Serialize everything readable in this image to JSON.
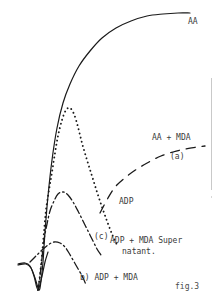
{
  "figure": {
    "caption": "fig.3",
    "background_color": "#ffffff",
    "ink_color": "#1a1a1a",
    "label_color": "#3a3a3a"
  },
  "labels": {
    "aa": "AA",
    "aa_mda": "AA + MDA",
    "a": "(a)",
    "adp": "ADP",
    "c": "(c)",
    "adp_mda_super": "ADP + MDA Super",
    "natant": "natant.",
    "b": "b) ADP + MDA"
  },
  "chart_data": {
    "type": "line",
    "title": "fig.3",
    "subtitle": "",
    "xlabel": "",
    "ylabel": "",
    "xlim": [
      0,
      220
    ],
    "ylim": [
      0,
      301
    ],
    "grid": false,
    "axes_visible": false,
    "legend": "inline-annotations",
    "note": "Platelet aggregometry traces; y axis inverted in pixel space (smaller y = greater aggregation).",
    "series": [
      {
        "name": "AA",
        "label": "AA",
        "style": "solid",
        "color": "#1a1a1a",
        "width": 1.2,
        "points": [
          [
            18,
            265
          ],
          [
            26,
            264
          ],
          [
            31,
            268
          ],
          [
            35,
            278
          ],
          [
            39,
            290
          ],
          [
            41,
            281
          ],
          [
            43,
            262
          ],
          [
            45,
            232
          ],
          [
            48,
            196
          ],
          [
            52,
            160
          ],
          [
            57,
            128
          ],
          [
            63,
            103
          ],
          [
            70,
            84
          ],
          [
            79,
            66
          ],
          [
            90,
            51
          ],
          [
            102,
            38
          ],
          [
            116,
            28
          ],
          [
            131,
            21
          ],
          [
            147,
            16
          ],
          [
            163,
            14
          ],
          [
            178,
            13
          ],
          [
            190,
            13
          ]
        ]
      },
      {
        "name": "ADP",
        "label": "ADP",
        "style": "dotted",
        "color": "#1a1a1a",
        "width": 1.6,
        "points": [
          [
            38,
            290
          ],
          [
            40,
            275
          ],
          [
            42,
            255
          ],
          [
            44,
            232
          ],
          [
            46,
            210
          ],
          [
            49,
            190
          ],
          [
            52,
            172
          ],
          [
            55,
            153
          ],
          [
            58,
            136
          ],
          [
            62,
            120
          ],
          [
            66,
            110
          ],
          [
            70,
            108
          ],
          [
            74,
            114
          ],
          [
            78,
            127
          ],
          [
            82,
            143
          ],
          [
            87,
            160
          ],
          [
            92,
            176
          ],
          [
            97,
            192
          ],
          [
            102,
            207
          ],
          [
            107,
            221
          ],
          [
            112,
            234
          ],
          [
            117,
            245
          ]
        ]
      },
      {
        "name": "AA + MDA",
        "label": "(a)",
        "style": "dashed",
        "color": "#1a1a1a",
        "width": 1.3,
        "dasharray": "9 7",
        "points": [
          [
            100,
            213
          ],
          [
            108,
            198
          ],
          [
            116,
            186
          ],
          [
            126,
            177
          ],
          [
            137,
            169
          ],
          [
            149,
            162
          ],
          [
            161,
            156
          ],
          [
            173,
            152
          ],
          [
            185,
            149
          ],
          [
            197,
            147
          ],
          [
            205,
            146
          ]
        ]
      },
      {
        "name": "ADP + MDA Supernatant",
        "label": "(c)",
        "style": "dash-dot",
        "color": "#1a1a1a",
        "width": 1.3,
        "dasharray": "8 3 1.5 3",
        "points": [
          [
            38,
            290
          ],
          [
            40,
            276
          ],
          [
            42,
            258
          ],
          [
            44,
            240
          ],
          [
            47,
            224
          ],
          [
            50,
            211
          ],
          [
            54,
            201
          ],
          [
            58,
            194
          ],
          [
            63,
            192
          ],
          [
            68,
            195
          ],
          [
            73,
            202
          ],
          [
            78,
            211
          ],
          [
            83,
            221
          ],
          [
            88,
            231
          ],
          [
            93,
            241
          ],
          [
            97,
            249
          ],
          [
            101,
            255
          ]
        ]
      },
      {
        "name": "ADP + MDA",
        "label": "b) ADP + MDA",
        "style": "dash-dot",
        "color": "#1a1a1a",
        "width": 1.3,
        "dasharray": "8 3 1.5 3",
        "points": [
          [
            30,
            262
          ],
          [
            36,
            256
          ],
          [
            42,
            250
          ],
          [
            48,
            245
          ],
          [
            54,
            242
          ],
          [
            60,
            243
          ],
          [
            65,
            247
          ],
          [
            69,
            253
          ],
          [
            73,
            260
          ],
          [
            77,
            267
          ],
          [
            81,
            274
          ],
          [
            84,
            280
          ],
          [
            86,
            285
          ]
        ]
      },
      {
        "name": "baseline-spike",
        "label": "",
        "style": "solid",
        "color": "#1a1a1a",
        "width": 1.2,
        "points": [
          [
            18,
            264
          ],
          [
            25,
            263
          ],
          [
            30,
            266
          ],
          [
            34,
            276
          ],
          [
            38,
            290
          ],
          [
            42,
            276
          ],
          [
            45,
            262
          ],
          [
            48,
            252
          ]
        ]
      }
    ]
  }
}
